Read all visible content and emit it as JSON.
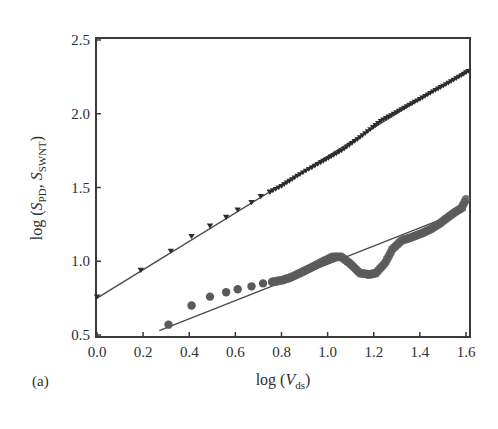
{
  "figure": {
    "panel_label": "(a)"
  },
  "colors": {
    "axes": "#3a3a3a",
    "upper_series": "#2b2b2b",
    "lower_series": "#5a5a5a",
    "fit_line": "#4a4a4a",
    "background": "#ffffff"
  },
  "chart_data": {
    "type": "scatter",
    "title": "",
    "panel": "(a)",
    "xlabel": "log (V_ds)",
    "xlabel_parts": {
      "prefix": "log (",
      "var": "V",
      "sub": "ds",
      "suffix": ")"
    },
    "ylabel": "log (S_PD, S_SWNT)",
    "ylabel_parts": {
      "prefix": "log (",
      "var1": "S",
      "sub1": "PD",
      "mid": ", ",
      "var2": "S",
      "sub2": "SWNT",
      "suffix": ")"
    },
    "xlim": [
      0.0,
      1.6
    ],
    "ylim": [
      0.5,
      2.5
    ],
    "xticks": [
      "0.0",
      "0.2",
      "0.4",
      "0.6",
      "0.8",
      "1.0",
      "1.2",
      "1.4",
      "1.6"
    ],
    "yticks": [
      "0.5",
      "1.0",
      "1.5",
      "2.0",
      "2.5"
    ],
    "grid": false,
    "legend": null,
    "series": [
      {
        "name": "S_PD (upper, triangles)",
        "marker": "triangle-down",
        "x": [
          0.0,
          0.19,
          0.32,
          0.41,
          0.49,
          0.56,
          0.61,
          0.67,
          0.71,
          0.75,
          0.8,
          0.88,
          0.97,
          1.06,
          1.14,
          1.23,
          1.32,
          1.4,
          1.49,
          1.58,
          1.61
        ],
        "y": [
          0.76,
          0.94,
          1.07,
          1.17,
          1.24,
          1.3,
          1.35,
          1.4,
          1.44,
          1.47,
          1.51,
          1.59,
          1.67,
          1.75,
          1.84,
          1.95,
          2.03,
          2.1,
          2.18,
          2.26,
          2.29
        ]
      },
      {
        "name": "S_SWNT (lower, circles)",
        "marker": "circle",
        "x": [
          0.31,
          0.41,
          0.49,
          0.56,
          0.61,
          0.67,
          0.72,
          0.76,
          0.8,
          0.84,
          0.88,
          0.92,
          0.97,
          1.02,
          1.06,
          1.1,
          1.14,
          1.18,
          1.21,
          1.25,
          1.28,
          1.32,
          1.36,
          1.41,
          1.45,
          1.49,
          1.54,
          1.58,
          1.6
        ],
        "y": [
          0.57,
          0.7,
          0.76,
          0.79,
          0.81,
          0.83,
          0.85,
          0.86,
          0.87,
          0.89,
          0.92,
          0.95,
          0.99,
          1.03,
          1.03,
          0.98,
          0.92,
          0.91,
          0.92,
          0.99,
          1.08,
          1.14,
          1.16,
          1.19,
          1.22,
          1.26,
          1.32,
          1.36,
          1.42
        ]
      }
    ],
    "fit_lines": [
      {
        "name": "upper fit",
        "x": [
          0.0,
          1.6
        ],
        "y": [
          0.75,
          2.29
        ]
      },
      {
        "name": "lower fit",
        "x": [
          0.27,
          1.6
        ],
        "y": [
          0.53,
          1.35
        ]
      }
    ]
  }
}
